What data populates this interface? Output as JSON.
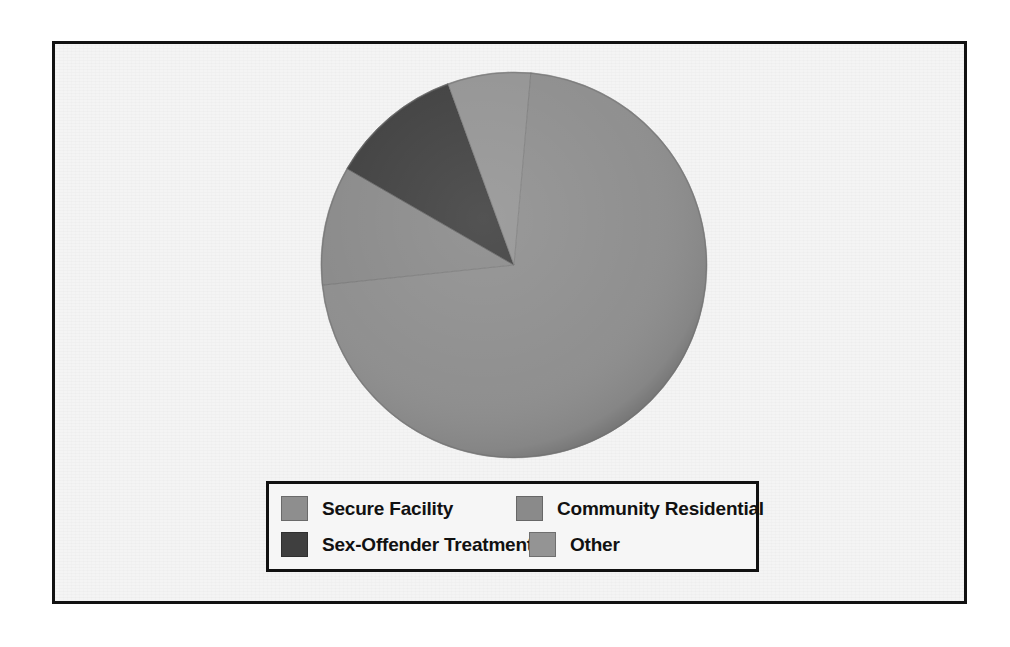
{
  "chart_data": {
    "type": "pie",
    "title": "",
    "subtitle": "",
    "xlabel": "",
    "ylabel": "",
    "grid": false,
    "legend_position": "bottom",
    "start_angle_deg": 0,
    "direction": "clockwise",
    "categories": [
      "Secure Facility",
      "Community Residential",
      "Sex-Offender Treatment",
      "Other"
    ],
    "values": [
      72,
      8,
      11,
      9
    ],
    "units": "percent",
    "slices": [
      {
        "label": "Secure Facility",
        "value": 72,
        "color": "#8e8e8e",
        "start_deg": 5,
        "end_deg": 264
      },
      {
        "label": "Community Residential",
        "value": 8,
        "color": "#8a8a8a",
        "start_deg": 264,
        "end_deg": 300
      },
      {
        "label": "Sex-Offender Treatment",
        "value": 11,
        "color": "#3f3f3f",
        "start_deg": 300,
        "end_deg": 340
      },
      {
        "label": "Other",
        "value": 9,
        "color": "#949494",
        "start_deg": 340,
        "end_deg": 365
      }
    ]
  },
  "figure": {
    "frame_border_color": "#111111",
    "plot_background": "#f4f4f4"
  },
  "legend": {
    "rows": [
      {
        "left": {
          "label": "Secure Facility",
          "color": "#8e8e8e"
        },
        "right": {
          "label": "Community Residential",
          "color": "#8a8a8a"
        }
      },
      {
        "left": {
          "label": "Sex-Offender Treatment",
          "color": "#3f3f3f"
        },
        "right": {
          "label": "Other",
          "color": "#949494"
        }
      }
    ]
  }
}
